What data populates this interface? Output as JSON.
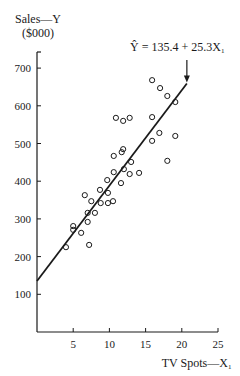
{
  "chart_data": {
    "type": "scatter",
    "title": "",
    "xlabel": "TV Spots—X₁",
    "ylabel": "Sales—Y",
    "ylabel_unit": "($000)",
    "xlim": [
      0,
      25
    ],
    "ylim": [
      0,
      750
    ],
    "x_ticks": [
      5,
      10,
      15,
      20,
      25
    ],
    "y_ticks": [
      100,
      200,
      300,
      400,
      500,
      600,
      700
    ],
    "grid": false,
    "legend": null,
    "annotation": {
      "text": "Ŷ = 135.4 + 25.3X₁",
      "arrow_to": [
        20.7,
        659
      ]
    },
    "regression_line": {
      "intercept": 135.4,
      "slope": 25.3,
      "x_start": 0,
      "x_end": 20.7
    },
    "series": [
      {
        "name": "observations",
        "marker": "open-circle",
        "points": [
          [
            15.9,
            668
          ],
          [
            17.0,
            647
          ],
          [
            18.0,
            626
          ],
          [
            19.1,
            610
          ],
          [
            10.9,
            568
          ],
          [
            11.9,
            560
          ],
          [
            12.8,
            568
          ],
          [
            15.9,
            570
          ],
          [
            11.7,
            477
          ],
          [
            15.9,
            507
          ],
          [
            16.9,
            528
          ],
          [
            19.1,
            520
          ],
          [
            18.0,
            454
          ],
          [
            11.9,
            485
          ],
          [
            10.6,
            467
          ],
          [
            13.0,
            451
          ],
          [
            12.0,
            432
          ],
          [
            10.6,
            424
          ],
          [
            12.8,
            419
          ],
          [
            14.1,
            422
          ],
          [
            9.7,
            403
          ],
          [
            11.6,
            395
          ],
          [
            8.7,
            377
          ],
          [
            9.8,
            369
          ],
          [
            6.6,
            363
          ],
          [
            7.5,
            347
          ],
          [
            8.8,
            342
          ],
          [
            9.8,
            342
          ],
          [
            10.5,
            347
          ],
          [
            7.0,
            316
          ],
          [
            8.0,
            316
          ],
          [
            7.0,
            292
          ],
          [
            5.0,
            281
          ],
          [
            5.0,
            271
          ],
          [
            6.1,
            263
          ],
          [
            7.2,
            231
          ],
          [
            4.0,
            225
          ]
        ]
      }
    ]
  },
  "labels": {
    "ylabel_line1": "Sales—Y",
    "ylabel_line2": "($000)",
    "xlabel": "TV Spots—X₁",
    "equation": "Ŷ = 135.4 + 25.3X₁"
  },
  "colors": {
    "ink": "#1a1a1a",
    "background": "#ffffff"
  }
}
